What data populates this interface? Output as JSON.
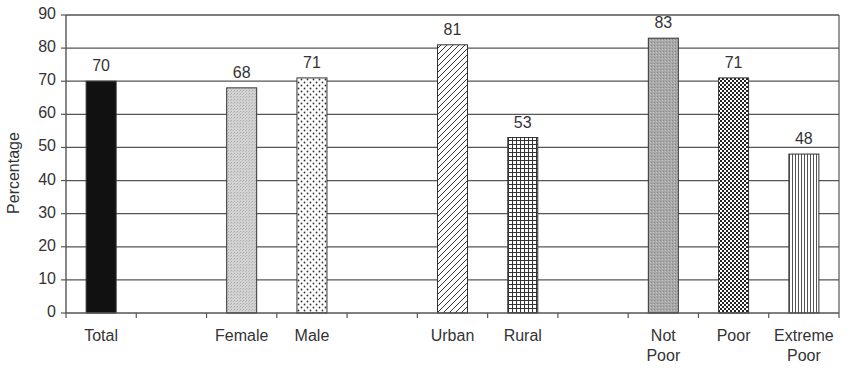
{
  "chart_data": {
    "type": "bar",
    "title": "",
    "xlabel": "",
    "ylabel": "Percentage",
    "ylim": [
      0,
      90
    ],
    "yticks": [
      0,
      10,
      20,
      30,
      40,
      50,
      60,
      70,
      80,
      90
    ],
    "grid": true,
    "legend": null,
    "slots": [
      "Total",
      "",
      "Female",
      "Male",
      "",
      "Urban",
      "Rural",
      "",
      "Not Poor",
      "Poor",
      "Extreme Poor"
    ],
    "categories": [
      "Total",
      "Female",
      "Male",
      "Urban",
      "Rural",
      "Not Poor",
      "Poor",
      "Extreme Poor"
    ],
    "values": [
      70,
      68,
      71,
      81,
      53,
      83,
      71,
      48
    ],
    "data_labels": [
      "70",
      "68",
      "71",
      "81",
      "53",
      "83",
      "71",
      "48"
    ],
    "bars": [
      {
        "label": "Total",
        "lines": [
          "Total"
        ],
        "value": 70,
        "slot": 0,
        "pattern": "solid-black"
      },
      {
        "label": "Female",
        "lines": [
          "Female"
        ],
        "value": 68,
        "slot": 2,
        "pattern": "light-gray-stipple"
      },
      {
        "label": "Male",
        "lines": [
          "Male"
        ],
        "value": 71,
        "slot": 3,
        "pattern": "dots"
      },
      {
        "label": "Urban",
        "lines": [
          "Urban"
        ],
        "value": 81,
        "slot": 5,
        "pattern": "diagonal-hatch"
      },
      {
        "label": "Rural",
        "lines": [
          "Rural"
        ],
        "value": 53,
        "slot": 6,
        "pattern": "grid"
      },
      {
        "label": "Not Poor",
        "lines": [
          "Not",
          "Poor"
        ],
        "value": 83,
        "slot": 8,
        "pattern": "medium-gray-stipple"
      },
      {
        "label": "Poor",
        "lines": [
          "Poor"
        ],
        "value": 71,
        "slot": 9,
        "pattern": "checker"
      },
      {
        "label": "Extreme Poor",
        "lines": [
          "Extreme",
          "Poor"
        ],
        "value": 48,
        "slot": 10,
        "pattern": "vertical-lines"
      }
    ],
    "colors": {
      "axis": "#555555",
      "grid": "#555555",
      "bar_border": "#333333"
    }
  }
}
